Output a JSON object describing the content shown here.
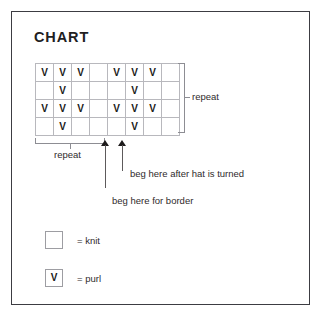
{
  "chart_data": {
    "type": "table",
    "title": "CHART",
    "columns": 8,
    "rows": 4,
    "symbols": {
      "purl": "V",
      "knit": ""
    },
    "grid": [
      [
        "V",
        "V",
        "V",
        "",
        "V",
        "V",
        "V",
        ""
      ],
      [
        "",
        "V",
        "",
        "",
        "",
        "V",
        "",
        ""
      ],
      [
        "V",
        "V",
        "V",
        "",
        "V",
        "V",
        "V",
        ""
      ],
      [
        "",
        "V",
        "",
        "",
        "",
        "V",
        "",
        ""
      ]
    ],
    "annotations": {
      "vertical_repeat_label": "repeat",
      "horizontal_repeat_label": "repeat",
      "arrow_border_label": "beg here for border",
      "arrow_turned_label": "beg here after hat is turned"
    },
    "legend": [
      {
        "symbol": "",
        "label": "= knit"
      },
      {
        "symbol": "V",
        "label": "= purl"
      }
    ],
    "grid_on": true,
    "xlabel": "",
    "ylabel": ""
  },
  "page": {
    "title": "CHART"
  },
  "annotations": {
    "vertical_repeat": "repeat",
    "horizontal_repeat": "repeat",
    "beg_border": "beg here for border",
    "beg_turned": "beg here after hat is turned"
  },
  "legend": {
    "knit": {
      "symbol": "",
      "label": "= knit"
    },
    "purl": {
      "symbol": "V",
      "label": "= purl"
    }
  }
}
